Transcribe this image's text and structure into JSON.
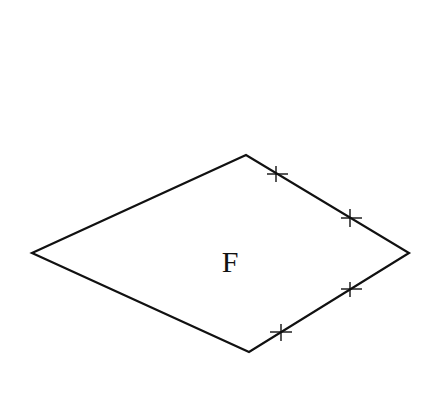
{
  "diagram": {
    "shape": "kite",
    "label": "F",
    "vertices": {
      "left": [
        32,
        253
      ],
      "top": [
        246,
        155
      ],
      "right": [
        409,
        253
      ],
      "bottom": [
        249,
        352
      ]
    },
    "tick_marks": [
      {
        "x": 276,
        "y": 174
      },
      {
        "x": 350,
        "y": 218
      },
      {
        "x": 350,
        "y": 290
      },
      {
        "x": 281,
        "y": 332
      }
    ],
    "stroke_color": "#111111",
    "background": "#ffffff"
  }
}
